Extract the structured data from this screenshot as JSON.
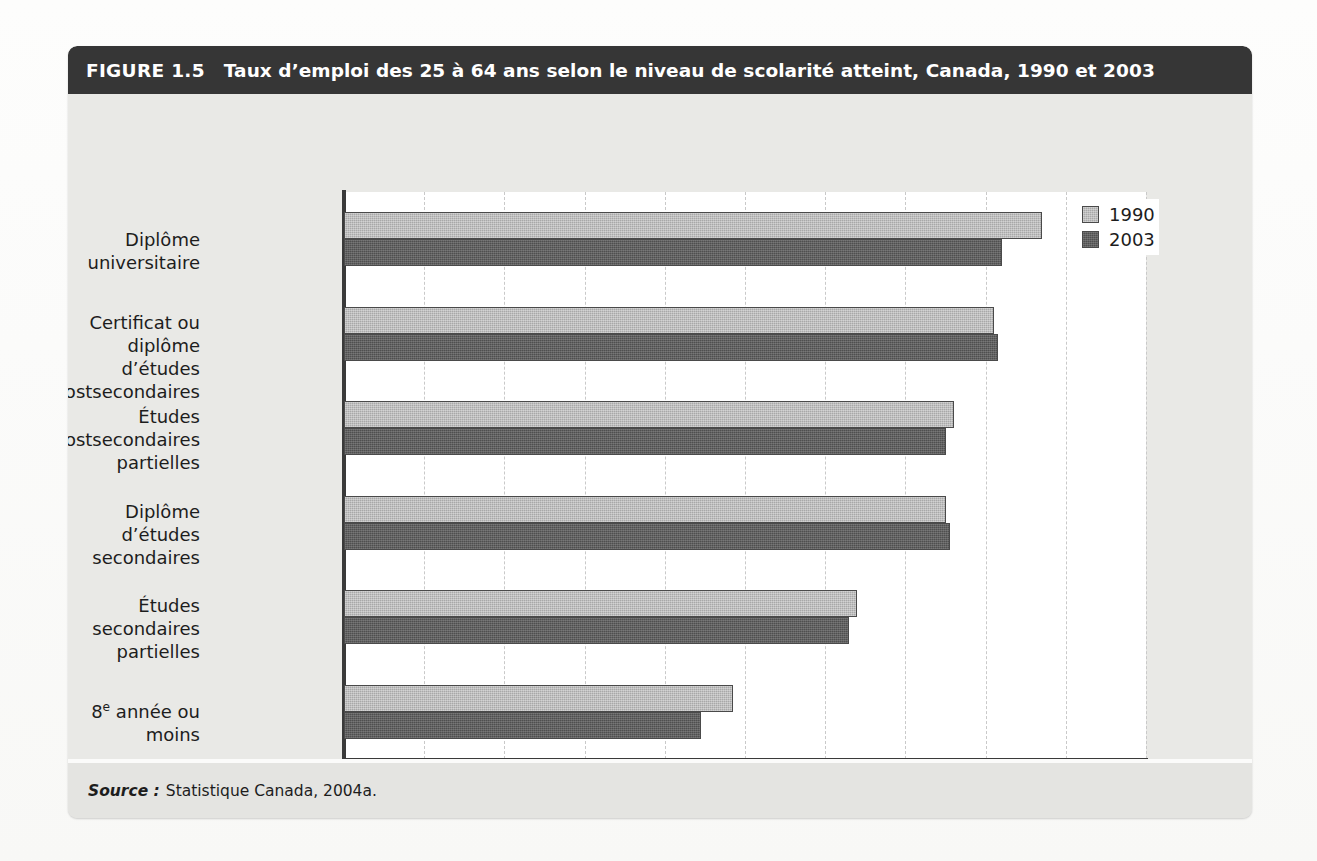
{
  "figure": {
    "number": "FIGURE 1.5",
    "title": "Taux d’emploi des 25 à 64 ans selon le niveau de scolarité atteint, Canada, 1990 et 2003",
    "source_label": "Source :",
    "source_text": "Statistique Canada, 2004a."
  },
  "colors": {
    "header_band": "#363636",
    "panel_background": "#e9e9e6",
    "plot_background": "#ffffff",
    "series_1990": "#a8a8a8",
    "series_2003": "#4f4f4f",
    "axis": "#3a3a3a",
    "gridline": "#c9c9c9",
    "text": "#1d1d1d"
  },
  "chart_data": {
    "type": "bar",
    "orientation": "horizontal",
    "title": "Taux d’emploi des 25 à 64 ans selon le niveau de scolarité atteint, Canada, 1990 et 2003",
    "xlabel": "%",
    "ylabel": "",
    "xlim": [
      0,
      100
    ],
    "xticks": [
      0,
      10,
      20,
      30,
      40,
      50,
      60,
      70,
      80,
      90,
      100
    ],
    "xtick_labels": [
      "0",
      "10",
      "20",
      "30",
      "40",
      "50",
      "60",
      "70",
      "80",
      "90",
      "100"
    ],
    "grid": "vertical-dashed",
    "legend_position": "top-right",
    "categories": [
      "Diplôme universitaire",
      "Certificat ou diplôme\nd’études postsecondaires",
      "Études postsecondaires\npartielles",
      "Diplôme d’études\nsecondaires",
      "Études secondaires\npartielles",
      "8e année ou moins"
    ],
    "series": [
      {
        "name": "1990",
        "color": "#a8a8a8",
        "values": [
          87,
          81,
          76,
          75,
          64,
          48.5
        ]
      },
      {
        "name": "2003",
        "color": "#4f4f4f",
        "values": [
          82,
          81.5,
          75,
          75.5,
          63,
          44.5
        ]
      }
    ]
  },
  "axis": {
    "percent_symbol": "%"
  },
  "legend": {
    "entries": [
      {
        "label": "1990",
        "swatch": "legend-swatch-1990"
      },
      {
        "label": "2003",
        "swatch": "legend-swatch-2003"
      }
    ]
  }
}
